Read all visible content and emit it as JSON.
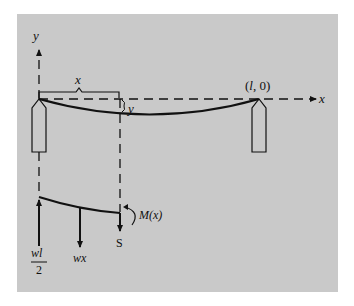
{
  "figure": {
    "axis_labels": {
      "x": "x",
      "y": "y"
    },
    "span_label": "x",
    "deflection_label": "y",
    "end_point_label": "(l, 0)",
    "free_body": {
      "reaction_numerator": "wl",
      "reaction_denominator": "2",
      "load_label": "wx",
      "shear_label": "S",
      "moment_label": "M(x)"
    },
    "colors": {
      "background": "#c9c9c9",
      "ink": "#111111"
    }
  }
}
